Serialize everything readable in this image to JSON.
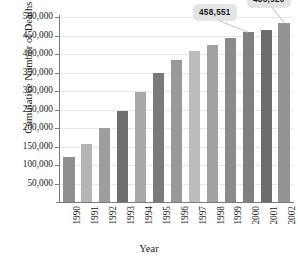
{
  "chart_data": {
    "type": "bar",
    "title": "",
    "xlabel": "Year",
    "ylabel": "Cumulative Number of Deaths",
    "categories": [
      "1990",
      "1991",
      "1992",
      "1993",
      "1994",
      "1995",
      "1996",
      "1997",
      "1998",
      "1999",
      "2000",
      "2001",
      "2002"
    ],
    "values": [
      122000,
      158000,
      200000,
      247000,
      296000,
      348000,
      385000,
      407000,
      425000,
      442000,
      458551,
      465000,
      483920
    ],
    "ylim": [
      0,
      500000
    ],
    "ytick_labels": [
      "500,000",
      "450,000",
      "400,000",
      "350,000",
      "300,000",
      "250,000",
      "200,000",
      "150,000",
      "100,000",
      "50,000"
    ],
    "ytick_values": [
      500000,
      450000,
      400000,
      350000,
      300000,
      250000,
      200000,
      150000,
      100000,
      50000
    ],
    "grid": true,
    "legend": "none",
    "bar_colors": [
      "#8f8f8f",
      "#b5b5b5",
      "#9d9d9d",
      "#6f6f6f",
      "#a8a8a8",
      "#7a7a7a",
      "#999999",
      "#bcbcbc",
      "#a2a2a2",
      "#8b8b8b",
      "#808080",
      "#6d6d6d",
      "#949494"
    ],
    "annotations": [
      {
        "label": "458,551",
        "category": "2000",
        "value": 458551
      },
      {
        "label": "483,920",
        "category": "2002",
        "value": 483920
      }
    ]
  }
}
